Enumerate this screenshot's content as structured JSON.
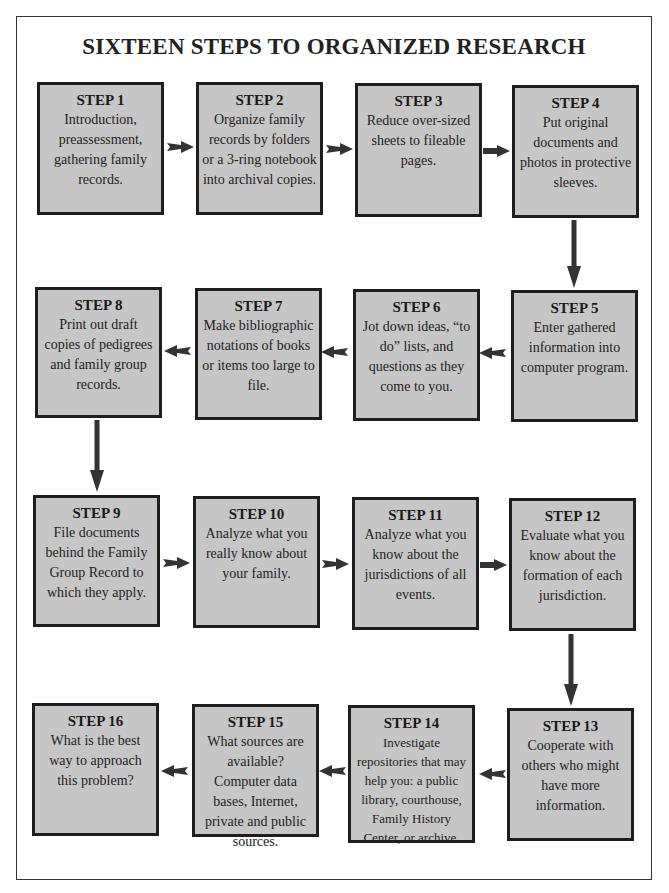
{
  "title": "SIXTEEN STEPS TO ORGANIZED RESEARCH",
  "colors": {
    "box_fill": "#c6c6c6",
    "box_border": "#1e1e1e",
    "arrow": "#333333",
    "frame": "#333333"
  },
  "steps": [
    {
      "label": "STEP 1",
      "text": "Introduction, preassessment, gathering family records."
    },
    {
      "label": "STEP 2",
      "text": "Organize family records by folders or a 3-ring notebook into archival copies."
    },
    {
      "label": "STEP 3",
      "text": "Reduce over-sized sheets to fileable pages."
    },
    {
      "label": "STEP 4",
      "text": "Put original documents and photos in protective sleeves."
    },
    {
      "label": "STEP 5",
      "text": "Enter gathered information into computer program."
    },
    {
      "label": "STEP 6",
      "text": "Jot down ideas, “to do” lists, and questions as they come to you."
    },
    {
      "label": "STEP 7",
      "text": "Make bibliographic notations of books or items too large to file."
    },
    {
      "label": "STEP 8",
      "text": "Print out draft copies of pedigrees and family group records."
    },
    {
      "label": "STEP 9",
      "text": "File documents behind the Family Group Record to which they apply."
    },
    {
      "label": "STEP 10",
      "text": "Analyze what you really know about your family."
    },
    {
      "label": "STEP 11",
      "text": "Analyze what you know about the jurisdictions of all events."
    },
    {
      "label": "STEP 12",
      "text": "Evaluate what you know about the formation of each jurisdiction."
    },
    {
      "label": "STEP 13",
      "text": "Cooperate with others who might have more information."
    },
    {
      "label": "STEP 14",
      "text": "Investigate repositories that may help you: a public library, courthouse, Family History Center, or archive."
    },
    {
      "label": "STEP 15",
      "text": "What sources are available? Computer data bases, Internet, private and public sources."
    },
    {
      "label": "STEP 16",
      "text": "What is the best way to approach this problem?"
    }
  ],
  "flow": [
    {
      "from": 1,
      "to": 2,
      "direction": "right"
    },
    {
      "from": 2,
      "to": 3,
      "direction": "right"
    },
    {
      "from": 3,
      "to": 4,
      "direction": "right"
    },
    {
      "from": 4,
      "to": 5,
      "direction": "down"
    },
    {
      "from": 5,
      "to": 6,
      "direction": "left"
    },
    {
      "from": 6,
      "to": 7,
      "direction": "left"
    },
    {
      "from": 7,
      "to": 8,
      "direction": "left"
    },
    {
      "from": 8,
      "to": 9,
      "direction": "down"
    },
    {
      "from": 9,
      "to": 10,
      "direction": "right"
    },
    {
      "from": 10,
      "to": 11,
      "direction": "right"
    },
    {
      "from": 11,
      "to": 12,
      "direction": "right"
    },
    {
      "from": 12,
      "to": 13,
      "direction": "down"
    },
    {
      "from": 13,
      "to": 14,
      "direction": "left"
    },
    {
      "from": 14,
      "to": 15,
      "direction": "left"
    },
    {
      "from": 15,
      "to": 16,
      "direction": "left"
    }
  ]
}
